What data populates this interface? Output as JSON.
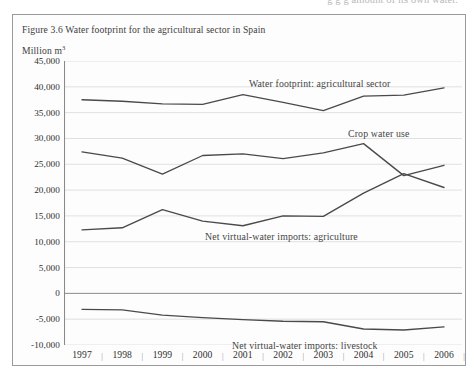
{
  "page_bleed_text": "g   g  g                     amount of its own water.",
  "figure": {
    "caption": "Figure 3.6  Water footprint for the agricultural sector in Spain",
    "unit_label": "Million m",
    "unit_superscript": "3"
  },
  "colors": {
    "line": "#4a4a4a",
    "gridline": "#dcdcdc",
    "axis": "#8a8a8a",
    "frame": "#9a9a9a",
    "text": "#3a3a3a",
    "page_background": "#ffffff"
  },
  "chart_data": {
    "type": "line",
    "title": "Figure 3.6  Water footprint for the agricultural sector in Spain",
    "xlabel": "",
    "ylabel": "Million m3",
    "ylim": [
      -10000,
      45000
    ],
    "ytick_step": 5000,
    "ytick_labels": [
      "45,000",
      "40,000",
      "35,000",
      "30,000",
      "25,000",
      "20,000",
      "15,000",
      "10,000",
      "5,000",
      "0",
      "-5,000",
      "-10,000"
    ],
    "ytick_values": [
      45000,
      40000,
      35000,
      30000,
      25000,
      20000,
      15000,
      10000,
      5000,
      0,
      -5000,
      -10000
    ],
    "grid": true,
    "legend": "in-plot labels",
    "categories": [
      "1997",
      "1998",
      "1999",
      "2000",
      "2001",
      "2002",
      "2003",
      "2004",
      "2005",
      "2006"
    ],
    "x": [
      1997,
      1998,
      1999,
      2000,
      2001,
      2002,
      2003,
      2004,
      2005,
      2006
    ],
    "series": [
      {
        "name": "Water footprint: agricultural sector",
        "label": "Water footprint: agricultural sector",
        "values": [
          37500,
          37200,
          36700,
          36600,
          38500,
          37000,
          35400,
          38200,
          38400,
          39800
        ]
      },
      {
        "name": "Crop water use",
        "label": "Crop water use",
        "values": [
          27400,
          26200,
          23100,
          26700,
          27000,
          26100,
          27200,
          29000,
          22800,
          24800
        ]
      },
      {
        "name": "Net virtual-water imports: agriculture",
        "label": "Net virtual-water imports: agriculture",
        "values": [
          12300,
          12700,
          16200,
          14000,
          13100,
          15000,
          14900,
          19400,
          23200,
          20500
        ]
      },
      {
        "name": "Net virtual-water imports: livestock",
        "label": "Net virtual-water imports: livestock",
        "values": [
          -3100,
          -3200,
          -4200,
          -4700,
          -5100,
          -5400,
          -5500,
          -6900,
          -7100,
          -6500
        ]
      }
    ],
    "series_label_positions": [
      {
        "name": "Water footprint: agricultural sector",
        "x_px": 249,
        "y_px": 78
      },
      {
        "name": "Crop water use",
        "x_px": 348,
        "y_px": 128
      },
      {
        "name": "Net virtual-water imports: agriculture",
        "x_px": 205,
        "y_px": 231
      },
      {
        "name": "Net virtual-water imports: livestock",
        "x_px": 232,
        "y_px": 340
      }
    ]
  }
}
